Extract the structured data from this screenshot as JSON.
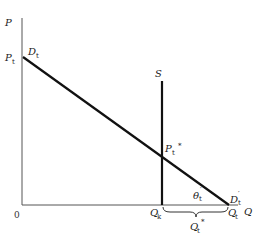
{
  "diagram": {
    "axes": {
      "y_label": "P",
      "x_label": "Q",
      "origin_label": "0"
    },
    "labels": {
      "price_intercept": {
        "main": "P",
        "sub": "t"
      },
      "demand_start": {
        "main": "D",
        "sub": "t"
      },
      "supply": "S",
      "equilibrium_price": {
        "main": "P",
        "sub": "t",
        "sup": "*"
      },
      "angle": {
        "main": "θ",
        "sub": "t",
        "sup": "′"
      },
      "demand_end": {
        "main": "D",
        "sub": "t",
        "sup": "′"
      },
      "q_k": {
        "main": "Q",
        "sub": "k"
      },
      "q_t": {
        "main": "Q",
        "sub": "t"
      },
      "q_t_star": {
        "main": "Q",
        "sub": "t",
        "sup": "*"
      }
    },
    "colors": {
      "line": "#111111",
      "axis": "#555555",
      "background": "#ffffff"
    }
  }
}
